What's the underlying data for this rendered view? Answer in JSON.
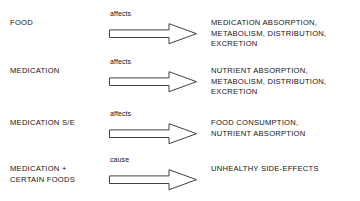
{
  "diagram": {
    "type": "flow-relationship-diagram",
    "line_color": "#2b2b2b",
    "text_color": "#141414",
    "background": "#ffffff",
    "rows": [
      {
        "source": "FOOD",
        "relation": "affects",
        "arrow": "open-block-arrow-right",
        "target": "MEDICATION ABSORPTION,\nMETABOLISM, DISTRIBUTION,\nEXCRETION"
      },
      {
        "source": "MEDICATION",
        "relation": "affects",
        "arrow": "open-block-arrow-right",
        "target": "NUTRIENT ABSORPTION,\nMETABOLISM, DISTRIBUTION,\nEXCRETION"
      },
      {
        "source": "MEDICATION S/E",
        "relation": "affects",
        "arrow": "open-block-arrow-right",
        "target": "FOOD CONSUMPTION,\nNUTRIENT ABSORPTION"
      },
      {
        "source": "MEDICATION +\nCERTAIN FOODS",
        "relation": "cause",
        "arrow": "open-block-arrow-right",
        "target": "UNHEALTHY SIDE-EFFECTS"
      }
    ]
  }
}
